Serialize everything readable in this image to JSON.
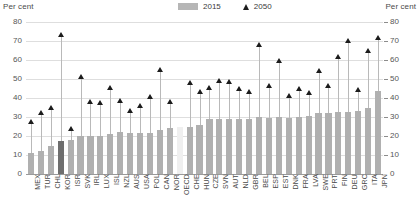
{
  "axis_title_left": "Per cent",
  "axis_title_right": "Per cent",
  "legend": [
    {
      "label": "2015",
      "marker": "bar-swatch",
      "color": "#b0b0b0"
    },
    {
      "label": "2050",
      "marker": "triangle-up",
      "color": "#1c1c1c"
    }
  ],
  "colors": {
    "bar": "#b0b0b0",
    "bar_highlight": "#6e6e6e",
    "bar_oecd": "#efefef",
    "marker": "#1c1c1c",
    "stem": "#b9b9b9",
    "gridline": "#dedede",
    "axis": "#9a9a9a"
  },
  "chart_data": {
    "type": "bar",
    "title": "",
    "subtitle": "",
    "xlabel": "",
    "ylabel": "Per cent",
    "ylim": [
      0,
      80
    ],
    "yticks": [
      0,
      10,
      20,
      30,
      40,
      50,
      60,
      70,
      80
    ],
    "grid": true,
    "legend_position": "top-center",
    "categories": [
      "MEX",
      "TUR",
      "CHL",
      "KOR",
      "ISR",
      "SVK",
      "IRL",
      "LUX",
      "ISL",
      "NZL",
      "AUS",
      "USA",
      "POL",
      "CAN",
      "NOR",
      "OECD",
      "CHE",
      "HUN",
      "CZE",
      "SVN",
      "AUT",
      "NLD",
      "GBR",
      "BEL",
      "ESP",
      "EST",
      "DNK",
      "FRA",
      "LVA",
      "SWE",
      "PRT",
      "FIN",
      "DEU",
      "GRC",
      "ITA",
      "JPN"
    ],
    "highlight_categories": [
      "KOR"
    ],
    "aggregate_categories": [
      "OECD"
    ],
    "series": [
      {
        "name": "2015",
        "type": "bar",
        "values": [
          11,
          12,
          15,
          17.5,
          18,
          20,
          20,
          20,
          21,
          22,
          21.5,
          21.5,
          21.5,
          23,
          24,
          24.5,
          25,
          26,
          29,
          29,
          29,
          29,
          29,
          30,
          29.5,
          30,
          29.5,
          30,
          30.5,
          32,
          32,
          32.5,
          32.5,
          33,
          34.5,
          43.5
        ]
      },
      {
        "name": "2050",
        "type": "scatter-marker",
        "values": [
          27.5,
          32,
          34.5,
          73,
          23.5,
          51,
          38,
          37.5,
          45.5,
          38.5,
          33,
          36,
          40.5,
          55,
          38,
          null,
          48,
          43,
          45.5,
          49,
          48.5,
          44.5,
          43,
          68,
          46.5,
          59.5,
          41,
          44.5,
          42.5,
          54,
          46.5,
          61.5,
          70,
          44,
          65,
          71.5
        ]
      }
    ]
  }
}
